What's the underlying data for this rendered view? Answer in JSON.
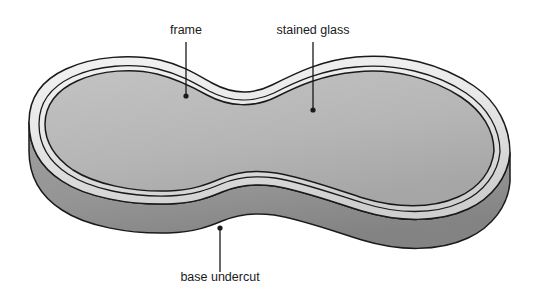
{
  "figure": {
    "type": "technical-illustration",
    "background_color": "#ffffff",
    "line_color": "#1a1a1a",
    "canvas": {
      "width": 540,
      "height": 296
    }
  },
  "parts": {
    "frame": {
      "name": "frame",
      "fill_light": "#eeeeee",
      "fill_dark": "#d2d2d2",
      "description": "outer light-grey rim band surrounding the glass"
    },
    "stained_glass": {
      "name": "stained glass",
      "fill_light": "#bdbdbd",
      "fill_dark": "#a8a8a8",
      "description": "large medium-grey top face inside the frame"
    },
    "base_undercut": {
      "name": "base undercut",
      "fill_light": "#9a9a9a",
      "fill_dark": "#868686",
      "description": "darker grey side wall below the frame, receding undercut"
    }
  },
  "callouts": [
    {
      "id": "frame",
      "label": "frame",
      "text_x": 186,
      "text_y": 34,
      "text_anchor": "middle",
      "leader_x1": 186,
      "leader_y1": 42,
      "leader_x2": 186,
      "leader_y2": 96,
      "dot_x": 186,
      "dot_y": 96,
      "dot_r": 2.6
    },
    {
      "id": "stained-glass",
      "label": "stained glass",
      "text_x": 313,
      "text_y": 34,
      "text_anchor": "middle",
      "leader_x1": 313,
      "leader_y1": 42,
      "leader_x2": 313,
      "leader_y2": 110,
      "dot_x": 313,
      "dot_y": 110,
      "dot_r": 2.6
    },
    {
      "id": "base-undercut",
      "label": "base undercut",
      "text_x": 220,
      "text_y": 281,
      "text_anchor": "middle",
      "leader_x1": 220,
      "leader_y1": 272,
      "leader_x2": 220,
      "leader_y2": 228,
      "dot_x": 220,
      "dot_y": 228,
      "dot_r": 2.6
    }
  ]
}
